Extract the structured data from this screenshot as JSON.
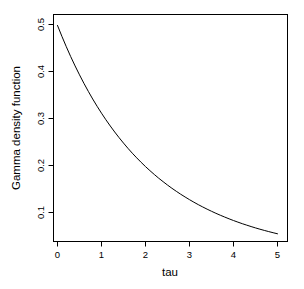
{
  "chart_data": {
    "type": "line",
    "title": "",
    "xlabel": "tau",
    "ylabel": "Gamma density function",
    "xlim": [
      -0.15,
      5.15
    ],
    "ylim": [
      0.036,
      0.513
    ],
    "grid": false,
    "legend": null,
    "xticks": [
      0,
      1,
      2,
      3,
      4,
      5
    ],
    "xticklabels": [
      "0",
      "1",
      "2",
      "3",
      "4",
      "5"
    ],
    "yticks": [
      0.1,
      0.2,
      0.3,
      0.4,
      0.5
    ],
    "yticklabels": [
      "0.1",
      "0.2",
      "0.3",
      "0.4",
      "0.5"
    ],
    "series": [
      {
        "name": "Gamma density",
        "color": "#000000",
        "x": [
          0.0,
          0.1,
          0.2,
          0.3,
          0.4,
          0.5,
          0.6,
          0.7,
          0.8,
          0.9,
          1.0,
          1.1,
          1.2,
          1.3,
          1.4,
          1.5,
          1.6,
          1.7,
          1.8,
          1.9,
          2.0,
          2.1,
          2.2,
          2.3,
          2.4,
          2.5,
          2.6,
          2.7,
          2.8,
          2.9,
          3.0,
          3.1,
          3.2,
          3.3,
          3.4,
          3.5,
          3.6,
          3.7,
          3.8,
          3.9,
          4.0,
          4.1,
          4.2,
          4.3,
          4.4,
          4.5,
          4.6,
          4.7,
          4.8,
          4.9,
          5.0
        ],
        "y": [
          0.498,
          0.4748,
          0.4527,
          0.4317,
          0.4118,
          0.3929,
          0.3749,
          0.3578,
          0.3415,
          0.326,
          0.3113,
          0.2973,
          0.284,
          0.2713,
          0.2592,
          0.2477,
          0.2367,
          0.2262,
          0.2163,
          0.2068,
          0.1977,
          0.1891,
          0.1809,
          0.173,
          0.1656,
          0.1584,
          0.1516,
          0.1451,
          0.1389,
          0.133,
          0.1273,
          0.1219,
          0.1167,
          0.1118,
          0.1071,
          0.1026,
          0.0983,
          0.0942,
          0.0903,
          0.0865,
          0.0829,
          0.0795,
          0.0762,
          0.0731,
          0.0701,
          0.0672,
          0.0645,
          0.0619,
          0.0594,
          0.057,
          0.0547
        ]
      }
    ]
  },
  "axes": {
    "x_title": "tau",
    "y_title": "Gamma density function",
    "x_tick_labels": [
      "0",
      "1",
      "2",
      "3",
      "4",
      "5"
    ],
    "y_tick_labels": [
      "0.1",
      "0.2",
      "0.3",
      "0.4",
      "0.5"
    ]
  },
  "style": {
    "background": "#ffffff",
    "axis_color": "#000000",
    "curve_color": "#000000"
  }
}
